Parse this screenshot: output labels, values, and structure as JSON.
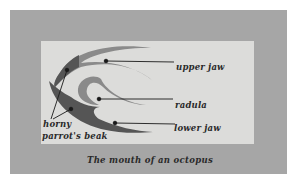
{
  "diagram": {
    "title": "The mouth of an octopus",
    "labels": {
      "upper_jaw": "upper jaw",
      "radula": "radula",
      "lower_jaw": "lower jaw",
      "beak_line1": "horny",
      "beak_line2": "parrot's beak"
    },
    "colors": {
      "outer_frame": "#a6a6a6",
      "inner_panel": "#dcdcda",
      "shape_dark": "#555555",
      "shape_mid": "#8a8a8a",
      "text": "#2a2a2a"
    }
  }
}
